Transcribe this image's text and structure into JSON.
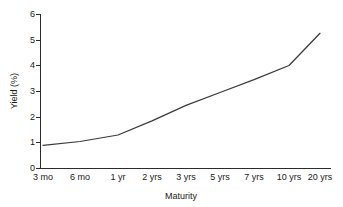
{
  "chart_data": {
    "type": "line",
    "title": "",
    "xlabel": "Maturity",
    "ylabel": "Yield (%)",
    "categories": [
      "3 mo",
      "6 mo",
      "1 yr",
      "2 yrs",
      "3 yrs",
      "5 yrs",
      "7 yrs",
      "10 yrs",
      "20 yrs"
    ],
    "values": [
      0.9,
      1.05,
      1.3,
      1.85,
      2.45,
      2.95,
      3.45,
      4.0,
      5.25
    ],
    "series": [
      {
        "name": "Yield curve",
        "values": [
          0.9,
          1.05,
          1.3,
          1.85,
          2.45,
          2.95,
          3.45,
          4.0,
          5.25
        ]
      }
    ],
    "ylim": [
      0,
      6
    ],
    "yticks": [
      0,
      1,
      2,
      3,
      4,
      5,
      6
    ],
    "ytick_labels": [
      "0",
      "1",
      "2",
      "3",
      "4",
      "5",
      "6"
    ],
    "grid": false,
    "legend": false,
    "legend_position": "none",
    "line_color": "#3a3a3a",
    "axis_color": "#2b2b2b",
    "background_color": "#ffffff"
  },
  "axis": {
    "y_title": "Yield (%)",
    "x_title": "Maturity",
    "y_labels": [
      "6",
      "5",
      "4",
      "3",
      "2",
      "1",
      "0"
    ],
    "x_labels": [
      "3 mo",
      "6 mo",
      "1 yr",
      "2 yrs",
      "3 yrs",
      "5 yrs",
      "7 yrs",
      "10 yrs",
      "20 yrs"
    ]
  }
}
